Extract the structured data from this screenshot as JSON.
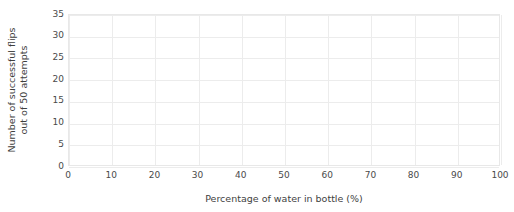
{
  "chart_data": {
    "type": "scatter",
    "title": "",
    "title_fragment": "",
    "xlabel": "Percentage of water in bottle (%)",
    "ylabel": "Number of successful flips out of 50 attempts",
    "ylabel_line1": "Number of successful flips",
    "ylabel_line2": "out of 50 attempts",
    "x_ticks": [
      0,
      10,
      20,
      30,
      40,
      50,
      60,
      70,
      80,
      90,
      100
    ],
    "y_ticks": [
      0,
      5,
      10,
      15,
      20,
      25,
      30,
      35
    ],
    "xlim": [
      0,
      100
    ],
    "ylim": [
      0,
      35
    ],
    "grid": true,
    "legend": "none",
    "series": [],
    "values": [],
    "categories": [],
    "note": "Empty plotting grid — no data series drawn",
    "colors": {
      "background": "#ffffff",
      "gridline": "#ececec",
      "axis_border": "#e8e8e8",
      "tick_text": "#4a4a4a",
      "axis_title_text": "#3f3f3f"
    }
  }
}
